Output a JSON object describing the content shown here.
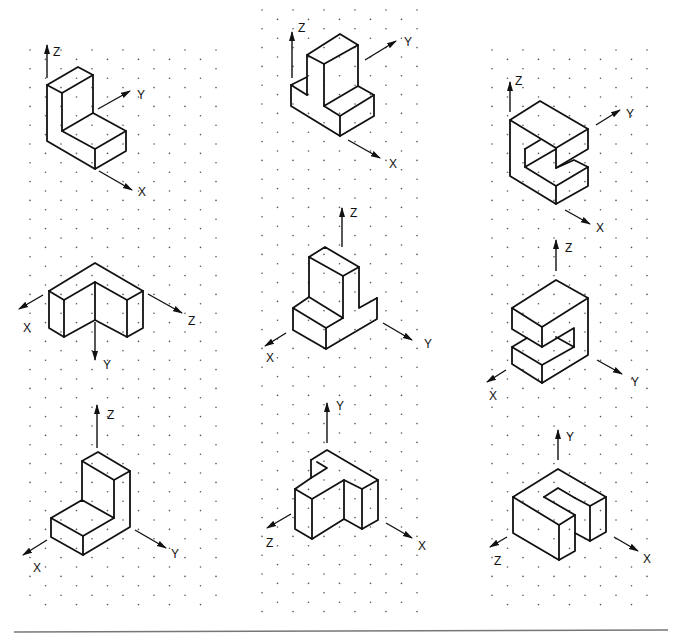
{
  "figure": {
    "panels": [
      {
        "id": "p1",
        "row": 1,
        "col": 1,
        "shape": "L-bracket",
        "axes": {
          "up": "Z",
          "right": "Y",
          "down_right": "X"
        }
      },
      {
        "id": "p2",
        "row": 1,
        "col": 2,
        "shape": "T-block",
        "axes": {
          "up": "Z",
          "right": "Y",
          "down_right": "X"
        }
      },
      {
        "id": "p3",
        "row": 1,
        "col": 3,
        "shape": "C-block",
        "axes": {
          "up": "Z",
          "right": "Y",
          "down_right": "X"
        }
      },
      {
        "id": "p4",
        "row": 2,
        "col": 1,
        "shape": "L-block inverted",
        "axes": {
          "left": "X",
          "down": "Y",
          "right": "Z"
        }
      },
      {
        "id": "p5",
        "row": 2,
        "col": 2,
        "shape": "T-block",
        "axes": {
          "up": "Z",
          "left": "X",
          "right": "Y"
        }
      },
      {
        "id": "p6",
        "row": 2,
        "col": 3,
        "shape": "C-block",
        "axes": {
          "up": "Z",
          "left": "X",
          "right": "Y"
        }
      },
      {
        "id": "p7",
        "row": 3,
        "col": 1,
        "shape": "L-bracket",
        "axes": {
          "up": "Z",
          "left": "X",
          "right": "Y"
        }
      },
      {
        "id": "p8",
        "row": 3,
        "col": 2,
        "shape": "T-block",
        "axes": {
          "up": "Y",
          "left": "Z",
          "right": "X"
        }
      },
      {
        "id": "p9",
        "row": 3,
        "col": 3,
        "shape": "U-block",
        "axes": {
          "up": "Y",
          "left": "Z",
          "right": "X"
        }
      }
    ]
  },
  "labels": {
    "p1": {
      "z": "Z",
      "y": "Y",
      "x": "X"
    },
    "p2": {
      "z": "Z",
      "y": "Y",
      "x": "X"
    },
    "p3": {
      "z": "Z",
      "y": "Y",
      "x": "X"
    },
    "p4": {
      "x": "X",
      "y": "Y",
      "z": "Z"
    },
    "p5": {
      "z": "Z",
      "x": "X",
      "y": "Y"
    },
    "p6": {
      "z": "Z",
      "x": "X",
      "y": "Y"
    },
    "p7": {
      "z": "Z",
      "x": "X",
      "y": "Y"
    },
    "p8": {
      "y": "Y",
      "z": "Z",
      "x": "X"
    },
    "p9": {
      "y": "Y",
      "z": "Z",
      "x": "X"
    }
  },
  "colors": {
    "ink": "#111111",
    "grid_dot": "#555555",
    "rule": "#777777",
    "background": "#ffffff"
  }
}
